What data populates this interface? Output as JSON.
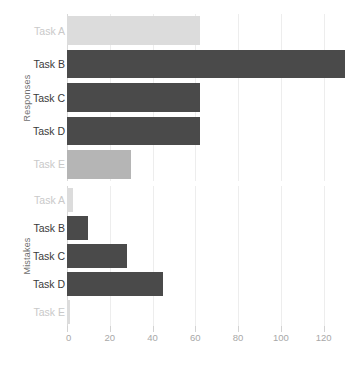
{
  "chart_data": {
    "type": "bar",
    "orientation": "horizontal",
    "title": "",
    "xlabel": "",
    "xlim": [
      0,
      130
    ],
    "xticks": [
      0,
      20,
      40,
      60,
      80,
      100,
      120
    ],
    "xtick_labels": [
      "0",
      "20",
      "40",
      "60",
      "80",
      "100",
      "120"
    ],
    "grid": true,
    "legend": "none",
    "categories": [
      "Task A",
      "Task B",
      "Task C",
      "Task D",
      "Task E"
    ],
    "panels": [
      {
        "name": "responses",
        "ylabel": "Responses",
        "bars": [
          {
            "category": "Task A",
            "value": 62,
            "tone": "light",
            "label_faded": true
          },
          {
            "category": "Task B",
            "value": 130,
            "tone": "dark",
            "label_faded": false
          },
          {
            "category": "Task C",
            "value": 62,
            "tone": "dark",
            "label_faded": false
          },
          {
            "category": "Task D",
            "value": 62,
            "tone": "dark",
            "label_faded": false
          },
          {
            "category": "Task E",
            "value": 30,
            "tone": "mid",
            "label_faded": true
          }
        ]
      },
      {
        "name": "mistakes",
        "ylabel": "Mistakes",
        "bars": [
          {
            "category": "Task A",
            "value": 3,
            "tone": "light",
            "label_faded": true
          },
          {
            "category": "Task B",
            "value": 10,
            "tone": "dark",
            "label_faded": false
          },
          {
            "category": "Task C",
            "value": 28,
            "tone": "dark",
            "label_faded": false
          },
          {
            "category": "Task D",
            "value": 45,
            "tone": "dark",
            "label_faded": false
          },
          {
            "category": "Task E",
            "value": 1.5,
            "tone": "light",
            "label_faded": true
          }
        ]
      }
    ],
    "colors": {
      "light": "#dcdcdc",
      "mid": "#b5b5b5",
      "dark": "#4a4a4a",
      "gridline": "#ededed",
      "axis_text": "#a8a8a8",
      "label_text": "#3a3a3a",
      "label_text_faded": "#c9c9c9",
      "background": "#ffffff"
    }
  }
}
